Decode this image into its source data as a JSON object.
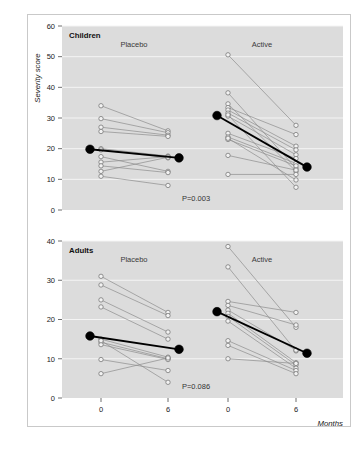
{
  "figure": {
    "y_axis_title": "Severity score",
    "x_axis_title": "Months"
  },
  "chart_data": {
    "type": "line",
    "xlabel": "Months",
    "ylabel": "Severity score",
    "grid": true,
    "legend": "none",
    "x": [
      0,
      6
    ],
    "x_tick_labels": [
      "0",
      "6",
      "0",
      "6"
    ],
    "panels": [
      {
        "name": "Children",
        "label": "Children",
        "ylim": [
          0,
          60
        ],
        "yticks": [
          0,
          10,
          20,
          30,
          40,
          50,
          60
        ],
        "ytick_labels": [
          "0",
          "10",
          "20",
          "30",
          "40",
          "50",
          "60"
        ],
        "pvalue": "P=0.003",
        "groups": [
          {
            "name": "Placebo",
            "label": "Placebo",
            "mean": {
              "baseline": 19.8,
              "month6": 17.0
            },
            "subjects": [
              {
                "baseline": 34.0,
                "month6": 25.8
              },
              {
                "baseline": 29.8,
                "month6": 25.2
              },
              {
                "baseline": 27.0,
                "month6": 24.4
              },
              {
                "baseline": 25.6,
                "month6": 24.0
              },
              {
                "baseline": 20.0,
                "month6": 17.6
              },
              {
                "baseline": 19.6,
                "month6": 17.0
              },
              {
                "baseline": 17.4,
                "month6": 12.6
              },
              {
                "baseline": 15.6,
                "month6": 17.4
              },
              {
                "baseline": 14.4,
                "month6": 12.2
              },
              {
                "baseline": 12.6,
                "month6": 17.2
              },
              {
                "baseline": 11.0,
                "month6": 8.0
              }
            ]
          },
          {
            "name": "Active",
            "label": "Active",
            "mean": {
              "baseline": 30.8,
              "month6": 14.0
            },
            "subjects": [
              {
                "baseline": 50.6,
                "month6": 27.6
              },
              {
                "baseline": 38.2,
                "month6": 13.6
              },
              {
                "baseline": 34.6,
                "month6": 12.6
              },
              {
                "baseline": 33.4,
                "month6": 24.6
              },
              {
                "baseline": 32.6,
                "month6": 20.8
              },
              {
                "baseline": 31.6,
                "month6": 19.6
              },
              {
                "baseline": 30.6,
                "month6": 18.0
              },
              {
                "baseline": 25.0,
                "month6": 16.8
              },
              {
                "baseline": 23.8,
                "month6": 15.2
              },
              {
                "baseline": 23.0,
                "month6": 14.4
              },
              {
                "baseline": 17.8,
                "month6": 13.0
              },
              {
                "baseline": 11.6,
                "month6": 11.6
              },
              {
                "baseline": 23.4,
                "month6": 9.8
              },
              {
                "baseline": 31.0,
                "month6": 7.4
              }
            ]
          }
        ]
      },
      {
        "name": "Adults",
        "label": "Adults",
        "ylim": [
          0,
          40
        ],
        "yticks": [
          0,
          10,
          20,
          30,
          40
        ],
        "ytick_labels": [
          "0",
          "10",
          "20",
          "30",
          "40"
        ],
        "pvalue": "P=0.086",
        "groups": [
          {
            "name": "Placebo",
            "label": "Placebo",
            "mean": {
              "baseline": 15.8,
              "month6": 12.4
            },
            "subjects": [
              {
                "baseline": 31.0,
                "month6": 21.8
              },
              {
                "baseline": 28.8,
                "month6": 21.0
              },
              {
                "baseline": 25.0,
                "month6": 16.8
              },
              {
                "baseline": 23.2,
                "month6": 15.0
              },
              {
                "baseline": 15.0,
                "month6": 10.4
              },
              {
                "baseline": 14.2,
                "month6": 10.0
              },
              {
                "baseline": 13.6,
                "month6": 9.8
              },
              {
                "baseline": 9.8,
                "month6": 7.0
              },
              {
                "baseline": 6.2,
                "month6": 10.2
              },
              {
                "baseline": 14.6,
                "month6": 4.0
              }
            ]
          },
          {
            "name": "Active",
            "label": "Active",
            "mean": {
              "baseline": 22.0,
              "month6": 11.4
            },
            "subjects": [
              {
                "baseline": 38.6,
                "month6": 18.0
              },
              {
                "baseline": 33.4,
                "month6": 12.0
              },
              {
                "baseline": 24.6,
                "month6": 21.8
              },
              {
                "baseline": 23.6,
                "month6": 18.6
              },
              {
                "baseline": 22.4,
                "month6": 12.2
              },
              {
                "baseline": 21.6,
                "month6": 9.0
              },
              {
                "baseline": 20.8,
                "month6": 8.4
              },
              {
                "baseline": 19.6,
                "month6": 7.6
              },
              {
                "baseline": 14.6,
                "month6": 7.0
              },
              {
                "baseline": 13.4,
                "month6": 6.2
              },
              {
                "baseline": 10.0,
                "month6": 8.8
              }
            ]
          }
        ]
      }
    ]
  }
}
